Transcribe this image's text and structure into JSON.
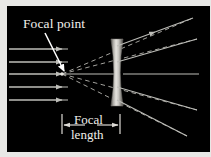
{
  "figure": {
    "title_visible": false,
    "background_color": "#000000",
    "frame_color": "#e8e8e6",
    "panel": {
      "x": 7,
      "y": 6,
      "width": 203,
      "height": 146
    }
  },
  "labels": {
    "focal_point": "Focal point",
    "focal_length_line1": "Focal",
    "focal_length_line2": "length"
  },
  "colors": {
    "ray": "#bdbdb8",
    "ray_dashed": "#9a9a95",
    "text": "#f2f0ec",
    "lens_light": "#e6e4df",
    "lens_mid": "#b4b2ad",
    "lens_dark": "#6e6c68",
    "background": "#000000",
    "pointer": "#ffffff"
  },
  "optics": {
    "lens_type": "biconcave-diverging",
    "lens_center_x": 117,
    "lens_top_y": 39,
    "lens_bottom_y": 106,
    "lens_half_width_edge": 6,
    "lens_half_width_waist": 2.2,
    "optical_axis_y": 74,
    "focal_point": {
      "x": 61,
      "y": 74
    },
    "incoming_ray_count": 5,
    "incoming_ray_y": [
      49,
      62,
      74,
      87,
      100
    ],
    "incoming_ray_start_x": 9,
    "incoming_ray_arrow_x": [
      57,
      57,
      160,
      57,
      57
    ],
    "outgoing_rays": [
      {
        "from_x": 117,
        "from_y": 49,
        "to_x": 196,
        "to_y": 16,
        "arrow_t": 0.46
      },
      {
        "from_x": 117,
        "from_y": 62,
        "to_x": 200,
        "to_y": 38,
        "arrow_t": 0.52
      },
      {
        "from_x": 117,
        "from_y": 74,
        "to_x": 200,
        "to_y": 74,
        "arrow_t": 0.55
      },
      {
        "from_x": 117,
        "from_y": 87,
        "to_x": 200,
        "to_y": 110,
        "arrow_t": 0.52
      },
      {
        "from_x": 117,
        "from_y": 100,
        "to_x": 190,
        "to_y": 136,
        "arrow_t": 0.5
      }
    ],
    "virtual_rays_dashed": [
      {
        "from_x": 61,
        "from_y": 74,
        "to_x": 196,
        "to_y": 16
      },
      {
        "from_x": 61,
        "from_y": 74,
        "to_x": 200,
        "to_y": 38
      },
      {
        "from_x": 61,
        "from_y": 74,
        "to_x": 200,
        "to_y": 110
      },
      {
        "from_x": 61,
        "from_y": 74,
        "to_x": 190,
        "to_y": 136
      }
    ],
    "focal_length_dimension": {
      "left_x": 61,
      "right_x": 119,
      "y": 124,
      "tick_half_height": 9
    }
  },
  "annotations": {
    "focal_point_label_pos": {
      "x": 22,
      "y": 22
    },
    "focal_point_leader": {
      "from_x": 44,
      "from_y": 26,
      "to_x": 63,
      "to_y": 72
    },
    "focal_length_label_pos": {
      "x": 90,
      "y": 121
    }
  }
}
